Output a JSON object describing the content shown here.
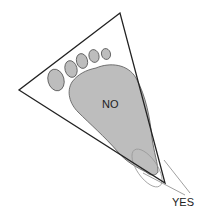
{
  "diagram": {
    "type": "foot-placement-diagram",
    "labels": {
      "no": "NO",
      "yes": "YES"
    },
    "colors": {
      "foot_fill": "#bdbdbd",
      "outline": "#222222",
      "leader_line": "#888888",
      "background": "#ffffff"
    }
  }
}
